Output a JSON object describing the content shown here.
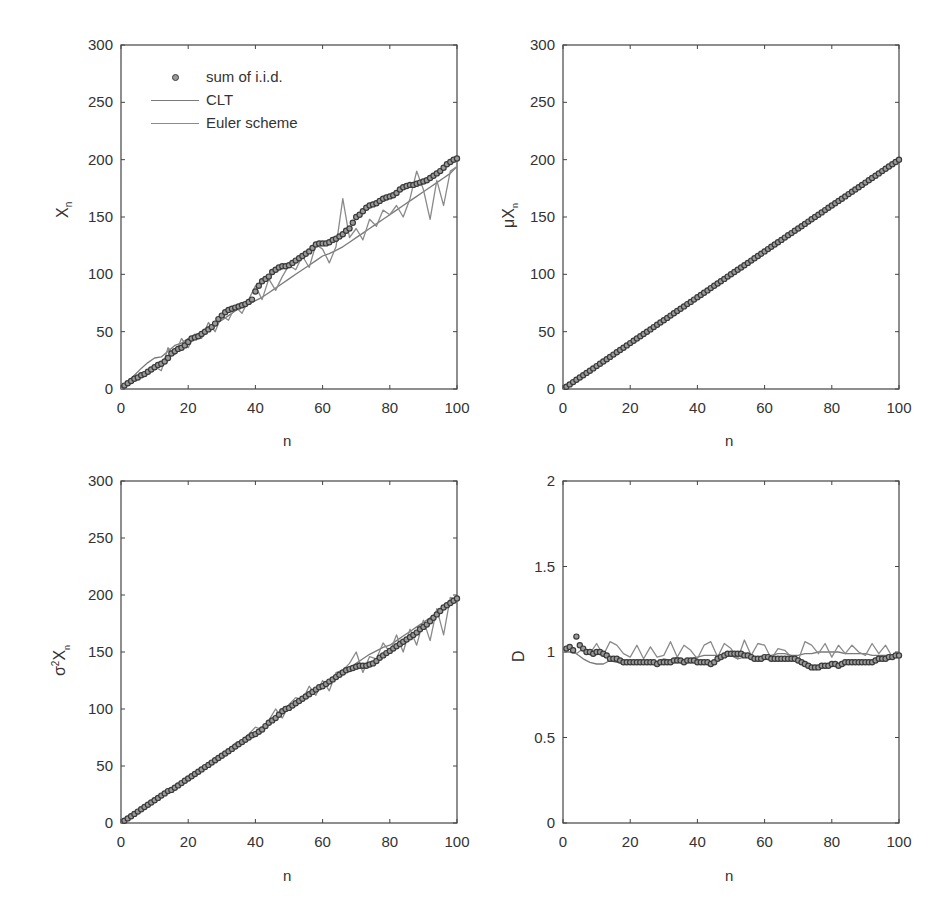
{
  "chart_data": [
    {
      "id": "p1",
      "type": "line",
      "title": "",
      "xlabel": "n",
      "ylabel": "X",
      "ylabel_sub": "n",
      "xlim": [
        0,
        100
      ],
      "ylim": [
        0,
        300
      ],
      "xticks": [
        0,
        20,
        40,
        60,
        80,
        100
      ],
      "yticks": [
        0,
        50,
        100,
        150,
        200,
        250,
        300
      ],
      "xtick_labels": [
        "0",
        "20",
        "40",
        "60",
        "80",
        "100"
      ],
      "ytick_labels": [
        "0",
        "50",
        "100",
        "150",
        "200",
        "250",
        "300"
      ],
      "legend": {
        "position": "upper-left",
        "entries": [
          "sum of i.i.d.",
          "CLT",
          "Euler scheme"
        ]
      },
      "series": [
        {
          "name": "sum of i.i.d.",
          "style": "marker",
          "x_step": 1,
          "values": [
            1,
            3,
            5,
            7,
            9,
            10,
            12,
            13,
            15,
            17,
            19,
            21,
            22,
            24,
            27,
            31,
            33,
            35,
            36,
            38,
            41,
            44,
            45,
            46,
            48,
            50,
            52,
            54,
            57,
            61,
            64,
            67,
            69,
            70,
            71,
            72,
            73,
            74,
            76,
            78,
            85,
            90,
            94,
            96,
            98,
            102,
            104,
            106,
            107,
            107,
            108,
            110,
            112,
            114,
            116,
            118,
            120,
            123,
            126,
            127,
            127,
            127,
            128,
            130,
            131,
            133,
            135,
            138,
            140,
            145,
            150,
            152,
            155,
            158,
            160,
            161,
            162,
            164,
            166,
            167,
            168,
            169,
            171,
            174,
            176,
            177,
            178,
            178,
            179,
            180,
            181,
            182,
            184,
            186,
            188,
            190,
            193,
            196,
            198,
            200,
            201
          ]
        },
        {
          "name": "CLT",
          "style": "line",
          "x_step": 2,
          "values": [
            0,
            6,
            12,
            18,
            23,
            27,
            28,
            33,
            38,
            40,
            44,
            46,
            50,
            54,
            57,
            60,
            64,
            68,
            72,
            74,
            77,
            80,
            84,
            88,
            92,
            96,
            100,
            104,
            108,
            112,
            116,
            118,
            121,
            124,
            128,
            132,
            136,
            140,
            144,
            148,
            152,
            156,
            160,
            164,
            168,
            172,
            176,
            180,
            184,
            188,
            194
          ]
        },
        {
          "name": "Euler scheme",
          "style": "line",
          "x_step": 2,
          "values": [
            0,
            4,
            9,
            13,
            16,
            20,
            16,
            36,
            30,
            44,
            36,
            48,
            44,
            58,
            50,
            64,
            60,
            72,
            66,
            78,
            90,
            78,
            96,
            86,
            98,
            108,
            104,
            116,
            106,
            126,
            122,
            110,
            124,
            166,
            132,
            140,
            130,
            148,
            142,
            156,
            152,
            160,
            150,
            166,
            190,
            174,
            148,
            182,
            160,
            190,
            194
          ]
        }
      ]
    },
    {
      "id": "p2",
      "type": "line",
      "title": "",
      "xlabel": "n",
      "ylabel": "μX",
      "ylabel_sub": "n",
      "xlim": [
        0,
        100
      ],
      "ylim": [
        0,
        300
      ],
      "xticks": [
        0,
        20,
        40,
        60,
        80,
        100
      ],
      "yticks": [
        0,
        50,
        100,
        150,
        200,
        250,
        300
      ],
      "xtick_labels": [
        "0",
        "20",
        "40",
        "60",
        "80",
        "100"
      ],
      "ytick_labels": [
        "0",
        "50",
        "100",
        "150",
        "200",
        "250",
        "300"
      ],
      "series": [
        {
          "name": "sum of i.i.d.",
          "style": "marker",
          "x_step": 1,
          "linear": {
            "slope": 2,
            "intercept": 0
          }
        },
        {
          "name": "CLT",
          "style": "line",
          "x_step": 2,
          "linear": {
            "slope": 2,
            "intercept": 0
          }
        },
        {
          "name": "Euler scheme",
          "style": "line",
          "x_step": 2,
          "linear": {
            "slope": 2,
            "intercept": 0
          }
        }
      ]
    },
    {
      "id": "p3",
      "type": "line",
      "title": "",
      "xlabel": "n",
      "ylabel": "σ²X",
      "ylabel_sub": "n",
      "xlim": [
        0,
        100
      ],
      "ylim": [
        0,
        300
      ],
      "xticks": [
        0,
        20,
        40,
        60,
        80,
        100
      ],
      "yticks": [
        0,
        50,
        100,
        150,
        200,
        250,
        300
      ],
      "xtick_labels": [
        "0",
        "20",
        "40",
        "60",
        "80",
        "100"
      ],
      "ytick_labels": [
        "0",
        "50",
        "100",
        "150",
        "200",
        "250",
        "300"
      ],
      "series": [
        {
          "name": "sum of i.i.d.",
          "style": "marker",
          "x_step": 1,
          "values": [
            0,
            2,
            4,
            6,
            8,
            10,
            12,
            14,
            16,
            18,
            20,
            22,
            24,
            26,
            28,
            29,
            31,
            33,
            35,
            37,
            39,
            41,
            43,
            45,
            47,
            49,
            51,
            53,
            55,
            57,
            59,
            61,
            63,
            65,
            67,
            69,
            71,
            73,
            75,
            77,
            78,
            80,
            82,
            85,
            88,
            90,
            92,
            95,
            98,
            100,
            101,
            103,
            105,
            107,
            109,
            111,
            113,
            115,
            117,
            119,
            120,
            122,
            124,
            126,
            128,
            130,
            132,
            134,
            135,
            136,
            137,
            138,
            138,
            138,
            139,
            140,
            142,
            145,
            147,
            149,
            151,
            153,
            155,
            157,
            159,
            161,
            163,
            165,
            167,
            170,
            172,
            174,
            177,
            180,
            183,
            186,
            189,
            191,
            193,
            195,
            197
          ]
        },
        {
          "name": "CLT",
          "style": "line",
          "x_step": 2,
          "values": [
            0,
            4,
            8,
            12,
            16,
            20,
            24,
            28,
            32,
            36,
            40,
            44,
            48,
            52,
            56,
            60,
            64,
            68,
            72,
            76,
            80,
            84,
            88,
            92,
            96,
            100,
            104,
            108,
            112,
            116,
            120,
            124,
            128,
            132,
            136,
            140,
            144,
            148,
            151,
            154,
            156,
            160,
            164,
            168,
            172,
            176,
            180,
            184,
            188,
            192,
            196
          ]
        },
        {
          "name": "Euler scheme",
          "style": "line",
          "x_step": 2,
          "values": [
            0,
            4,
            8,
            12,
            17,
            20,
            24,
            28,
            33,
            36,
            40,
            44,
            48,
            53,
            56,
            60,
            64,
            70,
            72,
            78,
            84,
            82,
            90,
            100,
            92,
            104,
            110,
            108,
            120,
            112,
            125,
            116,
            132,
            134,
            140,
            150,
            132,
            146,
            144,
            158,
            150,
            165,
            150,
            170,
            156,
            178,
            160,
            188,
            165,
            198,
            196
          ]
        }
      ]
    },
    {
      "id": "p4",
      "type": "line",
      "title": "",
      "xlabel": "n",
      "ylabel": "D",
      "ylabel_sub": "",
      "xlim": [
        0,
        100
      ],
      "ylim": [
        0,
        2
      ],
      "xticks": [
        0,
        20,
        40,
        60,
        80,
        100
      ],
      "yticks": [
        0,
        0.5,
        1,
        1.5,
        2
      ],
      "xtick_labels": [
        "0",
        "20",
        "40",
        "60",
        "80",
        "100"
      ],
      "ytick_labels": [
        "0",
        "0.5",
        "1",
        "1.5",
        "2"
      ],
      "series": [
        {
          "name": "sum of i.i.d.",
          "style": "marker",
          "x_step": 1,
          "values": [
            1.04,
            1.02,
            1.03,
            1.01,
            1.09,
            1.04,
            1.02,
            1.0,
            1.0,
            0.99,
            1.0,
            1.0,
            0.99,
            0.98,
            0.96,
            0.96,
            0.96,
            0.95,
            0.94,
            0.94,
            0.94,
            0.94,
            0.94,
            0.94,
            0.94,
            0.94,
            0.94,
            0.94,
            0.93,
            0.94,
            0.94,
            0.94,
            0.94,
            0.95,
            0.95,
            0.95,
            0.94,
            0.95,
            0.95,
            0.95,
            0.94,
            0.94,
            0.94,
            0.94,
            0.93,
            0.94,
            0.96,
            0.97,
            0.98,
            0.99,
            0.99,
            0.99,
            0.99,
            0.99,
            0.98,
            0.98,
            0.97,
            0.96,
            0.96,
            0.96,
            0.97,
            0.97,
            0.96,
            0.96,
            0.96,
            0.96,
            0.96,
            0.96,
            0.96,
            0.96,
            0.95,
            0.94,
            0.93,
            0.92,
            0.91,
            0.91,
            0.91,
            0.92,
            0.92,
            0.92,
            0.93,
            0.93,
            0.92,
            0.93,
            0.94,
            0.94,
            0.94,
            0.94,
            0.94,
            0.94,
            0.94,
            0.94,
            0.94,
            0.95,
            0.96,
            0.96,
            0.96,
            0.97,
            0.97,
            0.98,
            0.98
          ]
        },
        {
          "name": "CLT",
          "style": "line",
          "x_step": 2,
          "values": [
            1.0,
            1.0,
            0.99,
            0.96,
            0.94,
            0.93,
            0.93,
            0.95,
            0.94,
            0.94,
            0.95,
            0.94,
            0.93,
            0.95,
            0.94,
            0.96,
            0.95,
            0.97,
            0.95,
            0.96,
            0.97,
            0.98,
            0.98,
            0.98,
            0.97,
            0.98,
            0.96,
            0.97,
            0.98,
            0.96,
            0.97,
            0.98,
            0.99,
            0.99,
            0.98,
            0.98,
            0.99,
            0.99,
            1.0,
            1.0,
            1.0,
            1.0,
            0.99,
            0.99,
            0.99,
            0.99,
            0.98,
            0.98,
            0.98,
            0.98,
            0.98
          ]
        },
        {
          "name": "Euler scheme",
          "style": "line",
          "x_step": 2,
          "values": [
            1.0,
            1.04,
            0.99,
            1.02,
            0.99,
            1.05,
            0.98,
            1.06,
            1.04,
            0.99,
            0.97,
            1.04,
            0.96,
            1.03,
            0.97,
            0.98,
            1.06,
            0.97,
            1.04,
            1.01,
            0.96,
            1.04,
            1.06,
            0.97,
            1.05,
            1.02,
            0.96,
            1.07,
            0.98,
            1.05,
            1.04,
            0.96,
            1.02,
            1.01,
            0.97,
            0.95,
            1.06,
            1.04,
            0.99,
            1.05,
            0.97,
            1.04,
            0.99,
            1.04,
            1.0,
            0.98,
            1.05,
            0.99,
            1.04,
            0.97,
            1.0
          ]
        }
      ]
    }
  ],
  "panels": [
    {
      "ylabel_main": "X",
      "ylabel_sub": "n",
      "xlabel": "n"
    },
    {
      "ylabel_main": "μX",
      "ylabel_sub": "n",
      "xlabel": "n"
    },
    {
      "ylabel_main": "σ",
      "ylabel_sup": "2",
      "ylabel_tail": "X",
      "ylabel_sub": "n",
      "xlabel": "n"
    },
    {
      "ylabel_main": "D",
      "xlabel": "n"
    }
  ],
  "legend": {
    "entries": [
      {
        "label": "sum of i.i.d.",
        "marker": "circle"
      },
      {
        "label": "CLT",
        "marker": "line"
      },
      {
        "label": "Euler scheme",
        "marker": "line"
      }
    ]
  },
  "colors": {
    "axis": "#444444",
    "marker_edge": "#3a3a3a",
    "marker_fill": "#9a9a9a",
    "clt_line": "#7a7a7a",
    "euler_line": "#8a8a8a",
    "text": "#333333"
  }
}
